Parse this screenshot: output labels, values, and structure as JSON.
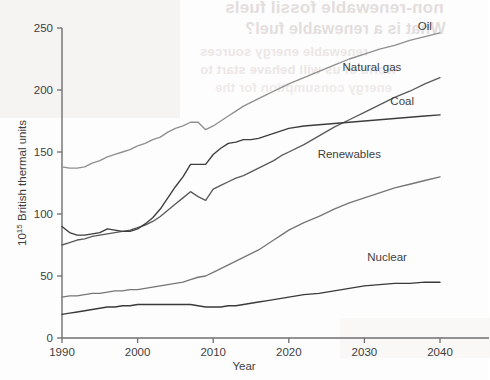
{
  "chart_data": {
    "type": "line",
    "title": "",
    "subtitle": "",
    "xlabel": "Year",
    "ylabel": "10¹⁵ British thermal units",
    "ylabel_base": "10",
    "ylabel_exponent": "15",
    "ylabel_rest": " British thermal units",
    "xlim": [
      1990,
      2040
    ],
    "ylim": [
      0,
      250
    ],
    "xticks": [
      1990,
      2000,
      2010,
      2020,
      2030,
      2040
    ],
    "xticklabels": [
      "1990",
      "2000",
      "2010",
      "2020",
      "2030",
      "2040"
    ],
    "yticks": [
      0,
      50,
      100,
      150,
      200,
      250
    ],
    "yticklabels": [
      "0",
      "50",
      "100",
      "150",
      "200",
      "250"
    ],
    "grid": false,
    "legend_position": "inline-right-of-line-ends",
    "x": [
      1990,
      1991,
      1992,
      1993,
      1994,
      1995,
      1996,
      1997,
      1998,
      1999,
      2000,
      2001,
      2002,
      2003,
      2004,
      2005,
      2006,
      2007,
      2008,
      2009,
      2010,
      2011,
      2012,
      2013,
      2014,
      2015,
      2016,
      2017,
      2018,
      2019,
      2020,
      2022,
      2024,
      2026,
      2028,
      2030,
      2032,
      2034,
      2036,
      2038,
      2040
    ],
    "series": [
      {
        "name": "Oil",
        "label": "Oil",
        "color": "#8f8f8f",
        "values": [
          138,
          137,
          137,
          138,
          141,
          143,
          146,
          148,
          150,
          152,
          155,
          157,
          160,
          162,
          166,
          169,
          171,
          174,
          174,
          168,
          171,
          175,
          179,
          183,
          187,
          190,
          193,
          196,
          199,
          202,
          205,
          210,
          215,
          220,
          225,
          229,
          233,
          236,
          240,
          243,
          246
        ]
      },
      {
        "name": "Natural gas",
        "label": "Natural gas",
        "color": "#5a5a5a",
        "values": [
          75,
          77,
          79,
          80,
          82,
          83,
          84,
          85,
          86,
          87,
          89,
          91,
          94,
          98,
          103,
          108,
          113,
          118,
          114,
          111,
          120,
          123,
          126,
          129,
          131,
          134,
          137,
          140,
          143,
          147,
          150,
          156,
          163,
          170,
          176,
          182,
          188,
          194,
          199,
          205,
          210
        ]
      },
      {
        "name": "Coal",
        "label": "Coal",
        "color": "#3d3d3d",
        "values": [
          90,
          85,
          83,
          83,
          84,
          85,
          88,
          87,
          86,
          86,
          88,
          92,
          97,
          104,
          113,
          122,
          130,
          140,
          140,
          140,
          148,
          153,
          157,
          158,
          160,
          160,
          161,
          163,
          165,
          167,
          169,
          171,
          172,
          173,
          174,
          175,
          176,
          177,
          178,
          179,
          180
        ]
      },
      {
        "name": "Renewables",
        "label": "Renewables",
        "color": "#767676",
        "values": [
          33,
          34,
          34,
          35,
          36,
          36,
          37,
          38,
          38,
          39,
          39,
          40,
          41,
          42,
          43,
          44,
          45,
          47,
          49,
          50,
          53,
          56,
          59,
          62,
          65,
          68,
          71,
          75,
          79,
          83,
          87,
          93,
          98,
          104,
          109,
          113,
          117,
          121,
          124,
          127,
          130
        ]
      },
      {
        "name": "Nuclear",
        "label": "Nuclear",
        "color": "#3a3a3a",
        "values": [
          19,
          20,
          21,
          22,
          23,
          24,
          25,
          25,
          26,
          26,
          27,
          27,
          27,
          27,
          27,
          27,
          27,
          27,
          26,
          25,
          25,
          25,
          26,
          26,
          27,
          28,
          29,
          30,
          31,
          32,
          33,
          35,
          36,
          38,
          40,
          42,
          43,
          44,
          44,
          45,
          45
        ]
      }
    ],
    "annotations": [
      {
        "name": "Oil",
        "x": 2038,
        "y": 248
      },
      {
        "name": "Natural gas",
        "x": 2031,
        "y": 215
      },
      {
        "name": "Coal",
        "x": 2035,
        "y": 188
      },
      {
        "name": "Renewables",
        "x": 2028,
        "y": 145
      },
      {
        "name": "Nuclear",
        "x": 2033,
        "y": 62
      }
    ]
  },
  "labels": {
    "y_axis_base": "10",
    "y_axis_exp": "15",
    "y_axis_text": " British thermal units",
    "x_axis_title": "Year",
    "ytick_250": "250",
    "ytick_200": "200",
    "ytick_150": "150",
    "ytick_100": "100",
    "ytick_50": "50",
    "ytick_0": "0",
    "xtick_1990": "1990",
    "xtick_2000": "2000",
    "xtick_2010": "2010",
    "xtick_2020": "2020",
    "xtick_2030": "2030",
    "xtick_2040": "2040",
    "series_oil": "Oil",
    "series_natural_gas": "Natural gas",
    "series_coal": "Coal",
    "series_renewables": "Renewables",
    "series_nuclear": "Nuclear"
  }
}
